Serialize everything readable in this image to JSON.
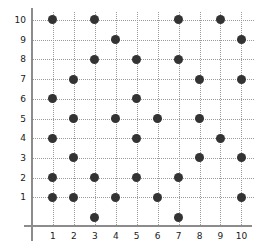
{
  "chart_data": {
    "type": "scatter",
    "title": "",
    "xlabel": "",
    "ylabel": "",
    "xlim": [
      0,
      10.6
    ],
    "ylim": [
      -0.4,
      10.4
    ],
    "grid": true,
    "legend": null,
    "xticks": [
      1,
      2,
      3,
      4,
      5,
      6,
      7,
      8,
      9,
      10
    ],
    "yticks": [
      1,
      2,
      3,
      4,
      5,
      6,
      7,
      8,
      9,
      10
    ],
    "xtick_labels": [
      "1",
      "2",
      "3",
      "4",
      "5",
      "6",
      "7",
      "8",
      "9",
      "10"
    ],
    "ytick_labels": [
      "1",
      "2",
      "3",
      "4",
      "5",
      "6",
      "7",
      "8",
      "9",
      "10"
    ],
    "marker_color": "#333333",
    "grid_color": "#9b9b9b",
    "axis_color": "#8c8c8c",
    "points": [
      {
        "x": 1,
        "y": 10
      },
      {
        "x": 1,
        "y": 6
      },
      {
        "x": 1,
        "y": 4
      },
      {
        "x": 1,
        "y": 2
      },
      {
        "x": 1,
        "y": 1
      },
      {
        "x": 2,
        "y": 7
      },
      {
        "x": 2,
        "y": 5
      },
      {
        "x": 2,
        "y": 3
      },
      {
        "x": 2,
        "y": 1
      },
      {
        "x": 3,
        "y": 10
      },
      {
        "x": 3,
        "y": 8
      },
      {
        "x": 3,
        "y": 2
      },
      {
        "x": 3,
        "y": 0
      },
      {
        "x": 4,
        "y": 9
      },
      {
        "x": 4,
        "y": 5
      },
      {
        "x": 4,
        "y": 1
      },
      {
        "x": 5,
        "y": 8
      },
      {
        "x": 5,
        "y": 6
      },
      {
        "x": 5,
        "y": 4
      },
      {
        "x": 5,
        "y": 2
      },
      {
        "x": 6,
        "y": 5
      },
      {
        "x": 6,
        "y": 1
      },
      {
        "x": 7,
        "y": 10
      },
      {
        "x": 7,
        "y": 8
      },
      {
        "x": 7,
        "y": 2
      },
      {
        "x": 7,
        "y": 0
      },
      {
        "x": 8,
        "y": 7
      },
      {
        "x": 8,
        "y": 5
      },
      {
        "x": 8,
        "y": 3
      },
      {
        "x": 9,
        "y": 10
      },
      {
        "x": 9,
        "y": 4
      },
      {
        "x": 10,
        "y": 9
      },
      {
        "x": 10,
        "y": 7
      },
      {
        "x": 10,
        "y": 3
      },
      {
        "x": 10,
        "y": 1
      }
    ]
  }
}
